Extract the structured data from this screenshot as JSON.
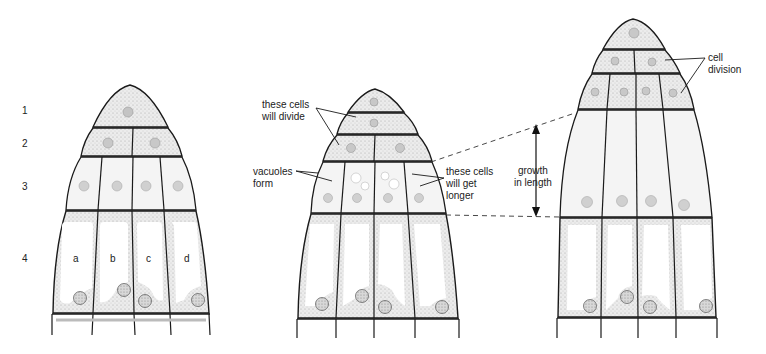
{
  "diagram": {
    "row_labels": [
      "1",
      "2",
      "3",
      "4"
    ],
    "cell_letters": [
      "a",
      "b",
      "c",
      "d"
    ],
    "stages": [
      {
        "id": "stage-1",
        "description": "initial root tip with rows 1-4"
      },
      {
        "id": "stage-2",
        "description": "top cells divide, row 3 forms vacuoles"
      },
      {
        "id": "stage-3",
        "description": "row 3 cells elongated, top cells divided"
      }
    ],
    "annotations": {
      "divide": "these cells\nwill divide",
      "vacuoles": "vacuoles\nform",
      "longer": "these cells\nwill get\nlonger",
      "growth": "growth\nin length",
      "cell_division": "cell\ndivision"
    },
    "colors": {
      "outline": "#1a1a1a",
      "cytoplasm": "#e6e6e6",
      "dense_cell": "#dcdcdc",
      "nucleus": "#8a8a8a",
      "nucleus_light": "#bdbdbd",
      "vacuole": "#ffffff",
      "dashed": "#333333"
    }
  }
}
